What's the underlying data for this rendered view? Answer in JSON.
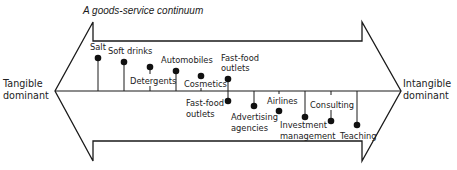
{
  "title": "A goods-service continuum",
  "ends": {
    "left": {
      "line1": "Tangible",
      "line2": "dominant"
    },
    "right": {
      "line1": "Intangible",
      "line2": "dominant"
    }
  },
  "upper_items": [
    {
      "label": "Salt"
    },
    {
      "label": "Soft drinks"
    },
    {
      "label": "Detergents"
    },
    {
      "label": "Automobiles"
    },
    {
      "label": "Cosmetics"
    },
    {
      "line1": "Fast-food",
      "line2": "outlets"
    }
  ],
  "lower_items": [
    {
      "line1": "Fast-food",
      "line2": "outlets"
    },
    {
      "line1": "Advertising",
      "line2": "agencies"
    },
    {
      "label": "Airlines"
    },
    {
      "line1": "Investment",
      "line2": "management"
    },
    {
      "label": "Consulting"
    },
    {
      "label": "Teaching"
    }
  ],
  "colors": {
    "line": "#1a1a1a",
    "background": "#ffffff"
  }
}
